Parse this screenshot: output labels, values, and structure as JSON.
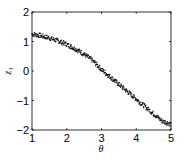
{
  "chart_data": {
    "type": "scatter",
    "title": "",
    "xlabel": "θ",
    "ylabel": "z₁",
    "xlim": [
      1,
      5
    ],
    "ylim": [
      -2,
      2
    ],
    "xticks": [
      "1",
      "2",
      "3",
      "4",
      "5"
    ],
    "yticks": [
      "2",
      "1",
      "0",
      "−1",
      "−2"
    ],
    "grid": false,
    "legend": null,
    "series": [
      {
        "name": "samples",
        "x": [
          1.0,
          1.25,
          1.5,
          1.75,
          2.0,
          2.25,
          2.5,
          2.75,
          3.0,
          3.25,
          3.5,
          3.75,
          4.0,
          4.25,
          4.5,
          4.75,
          5.0
        ],
        "y": [
          1.25,
          1.2,
          1.12,
          1.02,
          0.9,
          0.75,
          0.57,
          0.35,
          0.05,
          -0.2,
          -0.45,
          -0.7,
          -0.95,
          -1.2,
          -1.45,
          -1.7,
          -1.8
        ]
      }
    ]
  }
}
